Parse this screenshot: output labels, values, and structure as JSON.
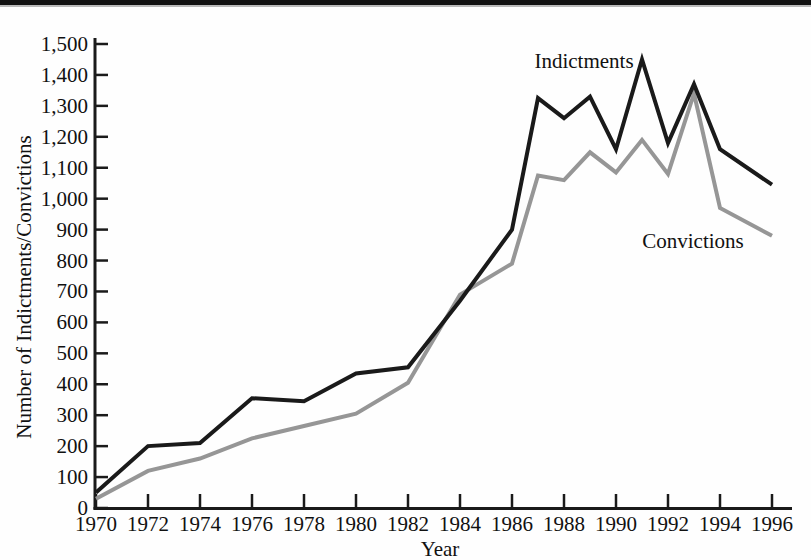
{
  "page": {
    "background": "#fefefe",
    "top_border_color": "#111111",
    "top_border_shadow_color": "#b9b9b9"
  },
  "chart_data": {
    "type": "line",
    "title": "",
    "xlabel": "Year",
    "ylabel": "Number of Indictments/Convictions",
    "xlim": [
      1970,
      1996
    ],
    "ylim": [
      0,
      1500
    ],
    "grid": false,
    "legend_position": "inline-annotations",
    "axis_color": "#1a1a1a",
    "x_ticks": [
      1970,
      1972,
      1974,
      1976,
      1978,
      1980,
      1982,
      1984,
      1986,
      1988,
      1990,
      1992,
      1994,
      1996
    ],
    "x_tick_labels": [
      "1970",
      "1972",
      "1974",
      "1976",
      "1978",
      "1980",
      "1982",
      "1984",
      "1986",
      "1988",
      "1990",
      "1992",
      "1994",
      "1996"
    ],
    "y_ticks": [
      0,
      100,
      200,
      300,
      400,
      500,
      600,
      700,
      800,
      900,
      1000,
      1100,
      1200,
      1300,
      1400,
      1500
    ],
    "y_tick_labels": [
      "0",
      "100",
      "200",
      "300",
      "400",
      "500",
      "600",
      "700",
      "800",
      "900",
      "1,000",
      "1,100",
      "1,200",
      "1,300",
      "1,400",
      "1,500"
    ],
    "series": [
      {
        "name": "Indictments",
        "color": "#1a1a1a",
        "x": [
          1970,
          1972,
          1974,
          1976,
          1978,
          1980,
          1982,
          1984,
          1986,
          1987,
          1988,
          1989,
          1990,
          1991,
          1992,
          1993,
          1994,
          1996
        ],
        "values": [
          50,
          200,
          210,
          355,
          345,
          435,
          455,
          670,
          900,
          1325,
          1260,
          1330,
          1160,
          1450,
          1180,
          1370,
          1160,
          1045
        ]
      },
      {
        "name": "Convictions",
        "color": "#969696",
        "x": [
          1970,
          1972,
          1974,
          1976,
          1978,
          1980,
          1982,
          1984,
          1986,
          1987,
          1988,
          1989,
          1990,
          1991,
          1992,
          1993,
          1994,
          1996
        ],
        "values": [
          30,
          120,
          160,
          225,
          265,
          305,
          405,
          690,
          790,
          1075,
          1060,
          1150,
          1085,
          1190,
          1080,
          1340,
          970,
          880
        ]
      }
    ]
  }
}
